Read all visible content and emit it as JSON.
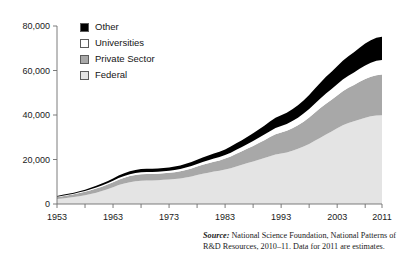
{
  "chart_data": {
    "type": "area",
    "title": "",
    "subtitle": "",
    "xlabel": "",
    "ylabel": "",
    "stacked": true,
    "grid": false,
    "legend_position": "top-left",
    "xlim": [
      1953,
      2011
    ],
    "ylim": [
      0,
      80000
    ],
    "xticks": [
      1953,
      1958,
      1963,
      1968,
      1973,
      1978,
      1983,
      1988,
      1993,
      1998,
      2003,
      2008,
      2011
    ],
    "xtick_labels": [
      "1953",
      "1963",
      "1973",
      "1983",
      "1993",
      "2003",
      "2011"
    ],
    "xtick_label_values": [
      1953,
      1963,
      1973,
      1983,
      1993,
      2003,
      2011
    ],
    "yticks": [
      0,
      20000,
      40000,
      60000,
      80000
    ],
    "ytick_labels": [
      "0",
      "20,000",
      "40,000",
      "60,000",
      "80,000"
    ],
    "x": [
      1953,
      1954,
      1955,
      1956,
      1957,
      1958,
      1959,
      1960,
      1961,
      1962,
      1963,
      1964,
      1965,
      1966,
      1967,
      1968,
      1969,
      1970,
      1971,
      1972,
      1973,
      1974,
      1975,
      1976,
      1977,
      1978,
      1979,
      1980,
      1981,
      1982,
      1983,
      1984,
      1985,
      1986,
      1987,
      1988,
      1989,
      1990,
      1991,
      1992,
      1993,
      1994,
      1995,
      1996,
      1997,
      1998,
      1999,
      2000,
      2001,
      2002,
      2003,
      2004,
      2005,
      2006,
      2007,
      2008,
      2009,
      2010,
      2011
    ],
    "series": [
      {
        "name": "Federal",
        "color": "#e4e4e4",
        "values": [
          2200,
          2500,
          2800,
          3100,
          3500,
          3900,
          4500,
          5100,
          5800,
          6600,
          7500,
          8500,
          9200,
          9800,
          10200,
          10500,
          10600,
          10600,
          10700,
          10900,
          11000,
          11200,
          11500,
          11900,
          12400,
          13000,
          13600,
          14100,
          14600,
          15000,
          15500,
          16100,
          16900,
          17600,
          18400,
          19100,
          19900,
          20700,
          21500,
          22200,
          22700,
          23200,
          23900,
          24800,
          25800,
          27000,
          28400,
          29800,
          31200,
          32600,
          34000,
          35400,
          36400,
          37200,
          38000,
          38800,
          39400,
          39800,
          39900
        ]
      },
      {
        "name": "Private Sector",
        "color": "#a8a8a8",
        "values": [
          900,
          1000,
          1100,
          1250,
          1400,
          1550,
          1700,
          1850,
          2000,
          2150,
          2300,
          2450,
          2600,
          2750,
          2850,
          2900,
          2900,
          2900,
          2900,
          2950,
          3000,
          3100,
          3200,
          3400,
          3600,
          3800,
          4000,
          4200,
          4400,
          4600,
          4900,
          5300,
          5700,
          6100,
          6500,
          7000,
          7500,
          8000,
          8600,
          9100,
          9400,
          9700,
          10100,
          10600,
          11200,
          11900,
          12600,
          13300,
          13900,
          14300,
          14800,
          15300,
          15800,
          16300,
          16900,
          17400,
          17800,
          18100,
          18300
        ]
      },
      {
        "name": "Universities",
        "color": "#ffffff",
        "values": [
          200,
          230,
          260,
          290,
          330,
          370,
          420,
          470,
          520,
          580,
          640,
          700,
          760,
          810,
          850,
          880,
          890,
          890,
          900,
          920,
          950,
          980,
          1020,
          1070,
          1120,
          1180,
          1250,
          1320,
          1400,
          1480,
          1570,
          1670,
          1780,
          1900,
          2030,
          2170,
          2320,
          2480,
          2650,
          2830,
          2980,
          3100,
          3250,
          3420,
          3620,
          3850,
          4100,
          4350,
          4600,
          4800,
          5000,
          5200,
          5400,
          5600,
          5850,
          6100,
          6300,
          6450,
          6500
        ]
      },
      {
        "name": "Other",
        "color": "#000000",
        "values": [
          350,
          380,
          420,
          470,
          530,
          600,
          680,
          760,
          850,
          950,
          1050,
          1150,
          1250,
          1330,
          1390,
          1420,
          1430,
          1430,
          1440,
          1460,
          1500,
          1550,
          1620,
          1700,
          1800,
          1900,
          2010,
          2130,
          2260,
          2400,
          2550,
          2720,
          2900,
          3100,
          3310,
          3530,
          3770,
          4030,
          4300,
          4580,
          4830,
          5050,
          5300,
          5580,
          5900,
          6260,
          6650,
          7060,
          7460,
          7780,
          8100,
          8430,
          8750,
          9080,
          9450,
          9820,
          10150,
          10400,
          10500
        ]
      }
    ],
    "totals_note": "Stacked totals rise from about 3,650 in 1953 to about 75,200 in 2011",
    "annotations": []
  },
  "legend": {
    "items": [
      {
        "label": "Other",
        "color": "#000000"
      },
      {
        "label": "Universities",
        "color": "#ffffff"
      },
      {
        "label": "Private Sector",
        "color": "#a8a8a8"
      },
      {
        "label": "Federal",
        "color": "#e4e4e4"
      }
    ]
  },
  "source": {
    "label": "Source:",
    "text": " National Science Foundation, National Patterns of R&D Resources, 2010–11. Data for 2011 are estimates."
  },
  "colors": {
    "axis": "#6d6d6d",
    "text": "#1a1a1a",
    "background": "#ffffff"
  }
}
